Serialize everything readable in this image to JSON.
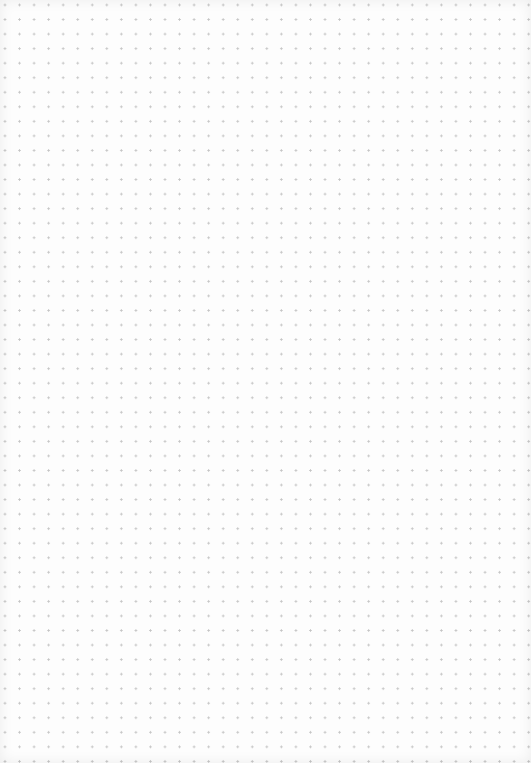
{
  "page": {
    "type": "dot-grid paper",
    "background_color": "#fdfdfd",
    "dot_color": "#c4c4c4",
    "dot_spacing_px": 14.55
  }
}
